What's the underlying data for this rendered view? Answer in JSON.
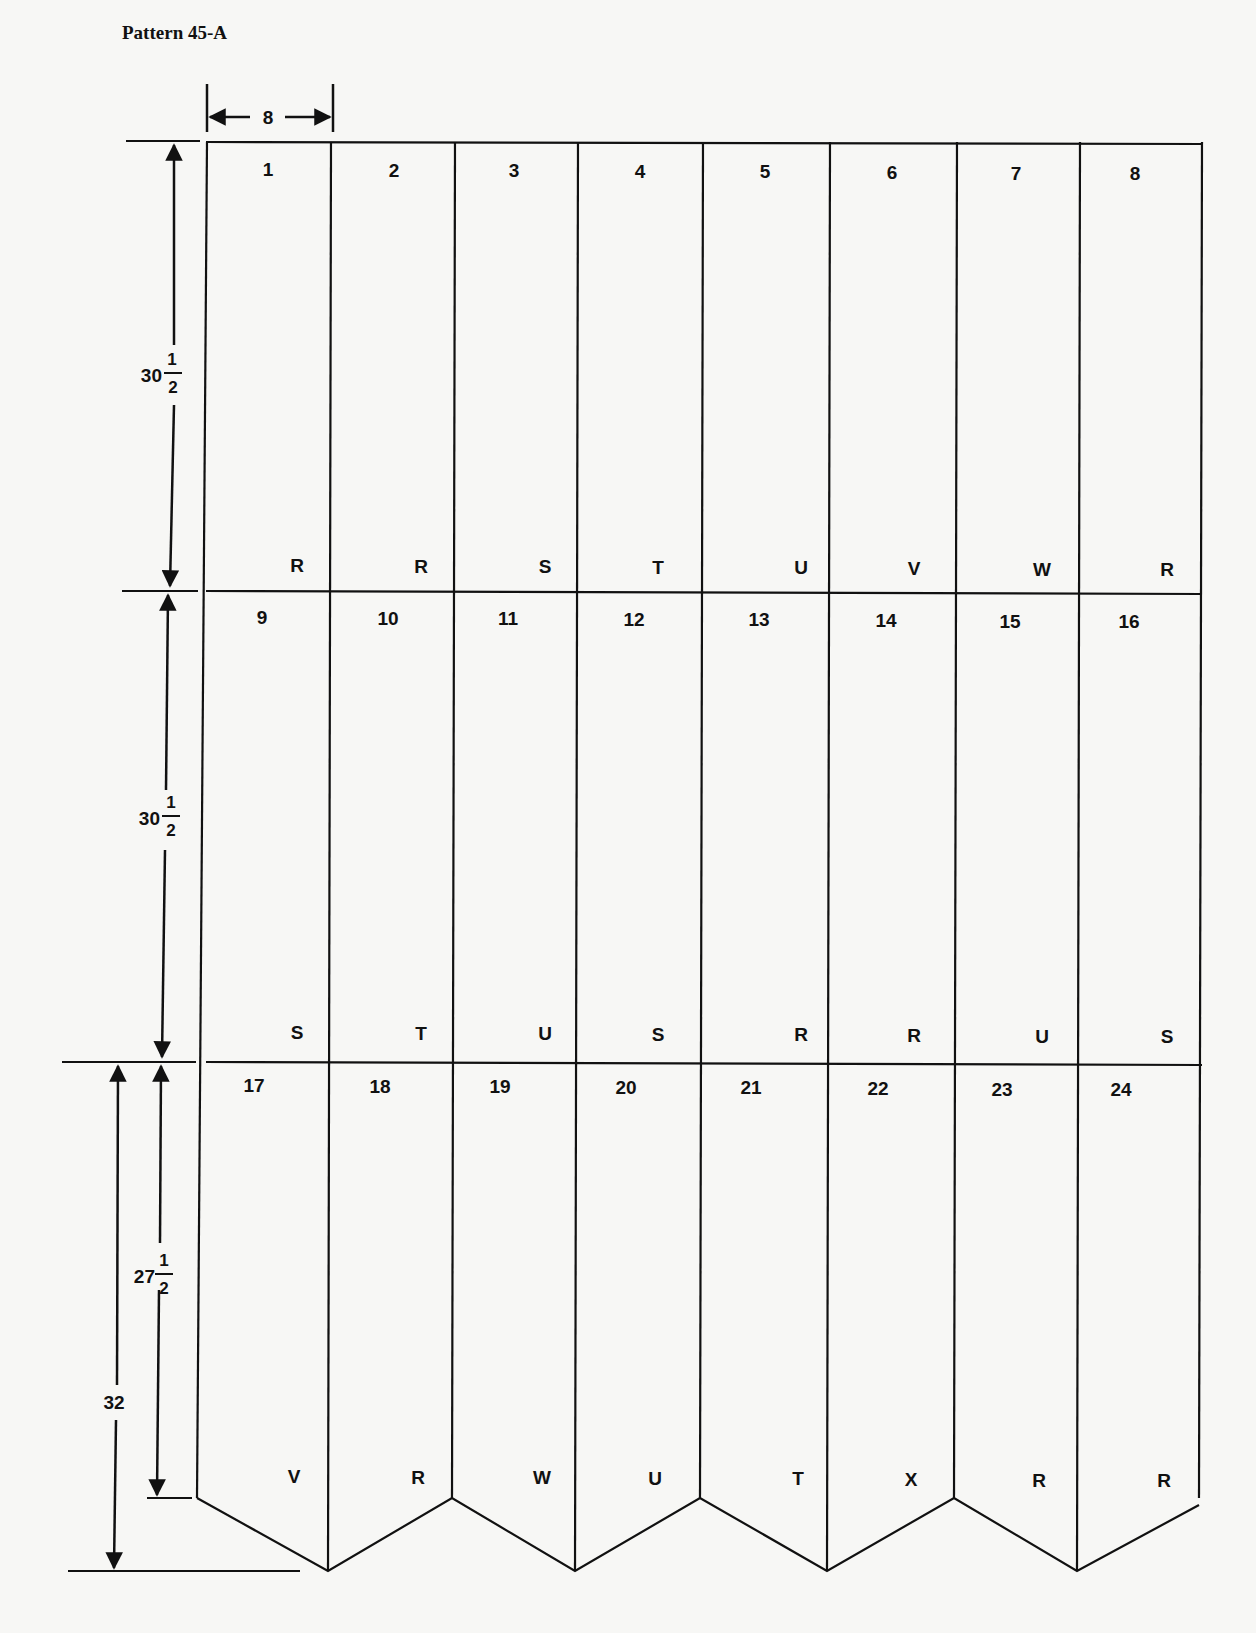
{
  "title": "Pattern 45-A",
  "dimensions": {
    "width": "8",
    "row1_height": {
      "whole": "30",
      "num": "1",
      "den": "2"
    },
    "row2_height": {
      "whole": "30",
      "num": "1",
      "den": "2"
    },
    "row3_height": {
      "whole": "27",
      "num": "1",
      "den": "2"
    },
    "total_point": "32"
  },
  "rows": [
    {
      "panels": [
        "1",
        "2",
        "3",
        "4",
        "5",
        "6",
        "7",
        "8"
      ],
      "bottom_labels": [
        "R",
        "R",
        "S",
        "T",
        "U",
        "V",
        "W",
        "R"
      ]
    },
    {
      "panels": [
        "9",
        "10",
        "11",
        "12",
        "13",
        "14",
        "15",
        "16"
      ],
      "bottom_labels": [
        "S",
        "T",
        "U",
        "S",
        "R",
        "R",
        "U",
        "S"
      ]
    },
    {
      "panels": [
        "17",
        "18",
        "19",
        "20",
        "21",
        "22",
        "23",
        "24"
      ],
      "bottom_labels": [
        "V",
        "R",
        "W",
        "U",
        "T",
        "X",
        "R",
        "R"
      ]
    }
  ],
  "colors": {
    "line": "#111111",
    "paper": "#f7f7f5"
  }
}
